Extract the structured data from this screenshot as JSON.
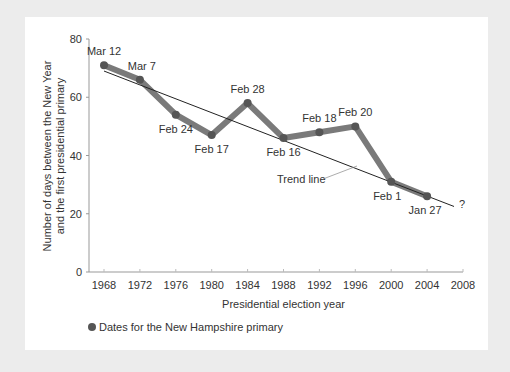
{
  "chart_data": {
    "type": "line",
    "title": "",
    "xlabel": "Presidential election year",
    "ylabel_line1": "Number of days between the New Year",
    "ylabel_line2": "and the first presidential primary",
    "x": [
      1968,
      1972,
      1976,
      1980,
      1984,
      1988,
      1992,
      1996,
      2000,
      2004
    ],
    "x_ticks": [
      1968,
      1972,
      1976,
      1980,
      1984,
      1988,
      1992,
      1996,
      2000,
      2004,
      2008
    ],
    "y_ticks": [
      0,
      20,
      40,
      60,
      80
    ],
    "ylim": [
      0,
      80
    ],
    "xlim": [
      1966.5,
      2008
    ],
    "series": [
      {
        "name": "Dates for the New Hampshire primary",
        "values": [
          71,
          66,
          54,
          47,
          58,
          46,
          48,
          50,
          31,
          26
        ],
        "point_labels": [
          "Mar 12",
          "Mar 7",
          "Feb 24",
          "Feb 17",
          "Feb 28",
          "Feb 16",
          "Feb 18",
          "Feb 20",
          "Feb 1",
          "Jan 27"
        ],
        "color": "#7a7a7a"
      }
    ],
    "trend_line": {
      "label": "Trend line",
      "start": [
        1968,
        69
      ],
      "end": [
        2007,
        22.5
      ],
      "color": "#222222"
    },
    "annotations": [
      {
        "text": "?",
        "x": 2008,
        "y": 23
      }
    ],
    "legend": {
      "position": "bottom-left",
      "label": "Dates for the New Hampshire primary"
    },
    "grid": false
  }
}
